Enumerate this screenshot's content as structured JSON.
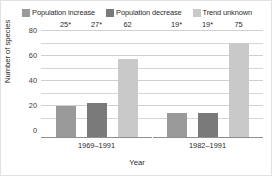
{
  "chart_data": {
    "type": "bar",
    "title": "",
    "subtitle": "",
    "xlabel": "Year",
    "ylabel": "Number of species",
    "categories": [
      "1969–1991",
      "1982–1991"
    ],
    "series": [
      {
        "name": "Population increase",
        "color": "#9a9a9a",
        "values": [
          25,
          27
        ],
        "labels": [
          "25*",
          "27*"
        ]
      },
      {
        "name": "Population decrease",
        "color": "#7a7a7a",
        "values": [
          27,
          19
        ],
        "labels": [
          "27*",
          "19*"
        ]
      },
      {
        "name": "Trend unknown",
        "color": "#c9c9c9",
        "values": [
          62,
          75
        ],
        "labels": [
          "62",
          "75"
        ]
      }
    ],
    "ylim": [
      0,
      85
    ],
    "yticks": [
      0,
      20,
      40,
      60,
      80
    ],
    "ytick_labels": [
      "0",
      "20",
      "40",
      "60",
      "80"
    ],
    "gridlines": [
      10,
      20,
      30,
      40,
      50,
      60,
      70,
      80
    ],
    "grid": true,
    "legend_position": "top"
  },
  "legend": {
    "entries": [
      {
        "label": "Population increase",
        "color": "#9a9a9a"
      },
      {
        "label": "Population decrease",
        "color": "#7a7a7a"
      },
      {
        "label": "Trend unknown",
        "color": "#c9c9c9"
      }
    ]
  },
  "axes": {
    "y_title": "Number of species",
    "x_title": "Year",
    "y_ticks": [
      "80",
      "60",
      "40",
      "20",
      "0"
    ],
    "x_ticks": [
      "1969–1991",
      "1982–1991"
    ]
  },
  "groups": [
    {
      "category": "1969–1991",
      "bars": [
        {
          "series": "Population increase",
          "value": 25,
          "label": "25*",
          "color": "#9a9a9a"
        },
        {
          "series": "Population decrease",
          "value": 27,
          "label": "27*",
          "color": "#7a7a7a"
        },
        {
          "series": "Trend unknown",
          "value": 62,
          "label": "62",
          "color": "#c9c9c9"
        }
      ]
    },
    {
      "category": "1982–1991",
      "bars": [
        {
          "series": "Population increase",
          "value": 19,
          "label": "19*",
          "color": "#9a9a9a"
        },
        {
          "series": "Population decrease",
          "value": 19,
          "label": "19*",
          "color": "#7a7a7a"
        },
        {
          "series": "Trend unknown",
          "value": 75,
          "label": "75",
          "color": "#c9c9c9"
        }
      ]
    }
  ]
}
